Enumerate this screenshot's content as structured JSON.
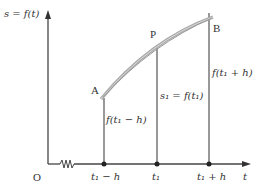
{
  "diagram": {
    "y_axis_label": "s = f(t)",
    "x_axis_label": "t",
    "origin_label": "O",
    "points": [
      {
        "name": "A",
        "label": "A"
      },
      {
        "name": "P",
        "label": "P"
      },
      {
        "name": "B",
        "label": "B"
      }
    ],
    "vertical_labels": {
      "left": "f(t₁ − h)",
      "middle": "s₁ = f(t₁)",
      "right": "f(t₁ + h)"
    },
    "tick_labels": [
      "t₁ − h",
      "t₁",
      "t₁ + h"
    ],
    "colors": {
      "axis": "#444444",
      "curve": "#a8a8a8",
      "text": "#333333"
    }
  }
}
